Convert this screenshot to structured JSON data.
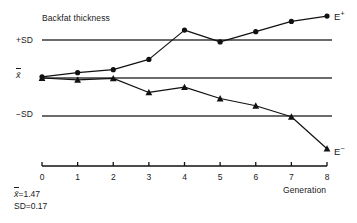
{
  "chart_data": {
    "type": "line",
    "title": "Backfat thickness",
    "xlabel": "Generation",
    "ylabel": "",
    "x": [
      0,
      1,
      2,
      3,
      4,
      5,
      6,
      7,
      8
    ],
    "xtick_labels": [
      "0",
      "1",
      "2",
      "3",
      "4",
      "5",
      "6",
      "7",
      "8"
    ],
    "xlim": [
      0,
      8
    ],
    "ylim_sd_units": [
      -2.6,
      2.1
    ],
    "grid": false,
    "legend_position": "end-of-line",
    "reference_lines": [
      {
        "key": "plus_sd",
        "label": "+SD",
        "value_sd": 1.0
      },
      {
        "key": "mean",
        "label": "x̄",
        "value_sd": 0.0
      },
      {
        "key": "minus_sd",
        "label": "−SD",
        "value_sd": -1.0
      }
    ],
    "series": [
      {
        "name": "E+",
        "end_label": "E",
        "end_label_sup": "+",
        "marker": "circle",
        "values_sd": [
          0.03,
          0.14,
          0.22,
          0.49,
          1.26,
          0.95,
          1.22,
          1.49,
          1.63
        ]
      },
      {
        "name": "E−",
        "end_label": "E",
        "end_label_sup": "−",
        "marker": "triangle",
        "values_sd": [
          0.0,
          -0.05,
          -0.01,
          -0.38,
          -0.24,
          -0.54,
          -0.73,
          -1.02,
          -1.86
        ]
      }
    ],
    "annotations": [
      {
        "key": "mean_stat",
        "prefix": "x̄",
        "text": "=1.47"
      },
      {
        "key": "sd_stat",
        "prefix": "SD",
        "text": "=0.17"
      }
    ],
    "colors": {
      "line": "#111111",
      "reference_line": "#3a3a3a",
      "axis": "#111111",
      "background": "#ffffff",
      "text": "#1a1a1a"
    }
  },
  "labels": {
    "title": "Backfat thickness",
    "plus_sd": "+SD",
    "mean": "x̄",
    "minus_sd": "−SD",
    "generation": "Generation",
    "e_plus_base": "E",
    "e_plus_sup": "+",
    "e_minus_base": "E",
    "e_minus_sup": "−",
    "mean_stat_symbol": "x̄",
    "mean_stat_value": "=1.47",
    "sd_stat_symbol": "SD",
    "sd_stat_value": "=0.17",
    "ticks": [
      "0",
      "1",
      "2",
      "3",
      "4",
      "5",
      "6",
      "7",
      "8"
    ]
  }
}
